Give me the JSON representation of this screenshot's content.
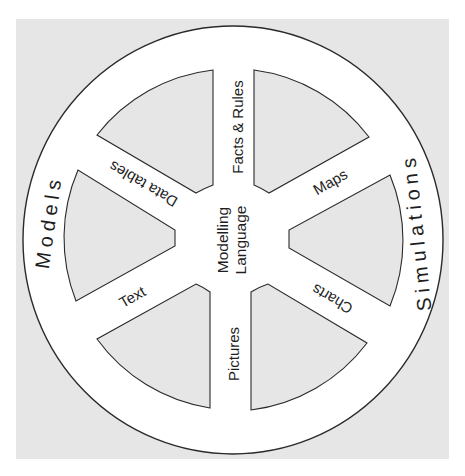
{
  "diagram": {
    "type": "wheel",
    "colors": {
      "background_panel": "#e6e6e6",
      "wheel_fill": "#ffffff",
      "sector_fill": "#e6e6e6",
      "stroke": "#2a2a2a",
      "text": "#1e1e1e"
    },
    "hub": {
      "line1": "Modelling",
      "line2": "Language"
    },
    "spokes": [
      {
        "label": "Facts & Rules",
        "angle_deg": 0
      },
      {
        "label": "Maps",
        "angle_deg": 60
      },
      {
        "label": "Charts",
        "angle_deg": 120
      },
      {
        "label": "Pictures",
        "angle_deg": 180
      },
      {
        "label": "Text",
        "angle_deg": 240
      },
      {
        "label": "Data tables",
        "angle_deg": 300
      }
    ],
    "rim": {
      "left_label": "Models",
      "right_label": "Simulations"
    }
  }
}
